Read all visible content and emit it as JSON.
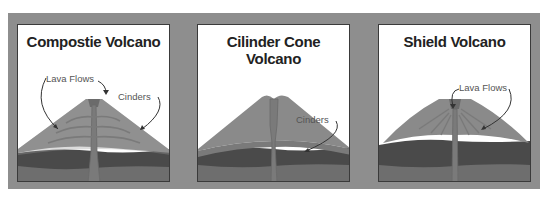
{
  "panels": [
    {
      "title": "Compostie Volcano",
      "labels": [
        "Lava Flows",
        "Cinders"
      ]
    },
    {
      "title": "Cilinder Cone Volcano",
      "labels": [
        "Cinders"
      ]
    },
    {
      "title": "Shield Volcano",
      "labels": [
        "Lava Flows"
      ]
    }
  ],
  "colors": {
    "frame": "#8e8e8e",
    "panel_bg": "#ffffff",
    "cone": "#8a8a8a",
    "cone_light": "#9a9a9a",
    "layer_dark": "#4a4a4a",
    "layer_mid": "#6e6e6e",
    "conduit": "#7d7d7d"
  }
}
